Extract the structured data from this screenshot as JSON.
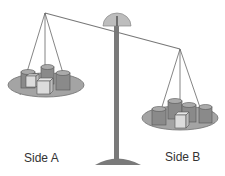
{
  "diagram": {
    "type": "balance-scale",
    "beam_tilt": "left side up, right side down",
    "colors": {
      "pan": "#a4a4a4",
      "pan_edge": "#6e6e6e",
      "stand": "#7a7a7a",
      "dial": "#bdbdbd",
      "cylinder": "#8a8a8a",
      "cylinder_top": "#aaaaaa",
      "cube_front": "#dcdcdc",
      "cube_side": "#bcbcbc",
      "string": "#666666"
    },
    "sides": [
      {
        "label": "Side A",
        "position": "left",
        "cylinders": 3,
        "cubes": 2
      },
      {
        "label": "Side B",
        "position": "right",
        "cylinders": 4,
        "cubes": 1
      }
    ]
  }
}
